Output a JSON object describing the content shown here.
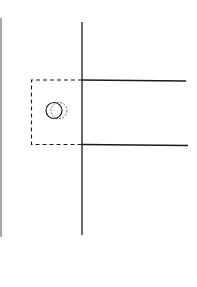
{
  "diagram": {
    "kind": "line-drawing",
    "colors": {
      "background": "#ffffff",
      "stroke": "#1a1a1a",
      "edge": "#8a8a8a"
    },
    "elements": [
      {
        "name": "left-edge-line",
        "type": "line",
        "style": "solid"
      },
      {
        "name": "main-vertical-line",
        "type": "line",
        "style": "solid"
      },
      {
        "name": "top-horizontal-line",
        "type": "line",
        "style": "solid"
      },
      {
        "name": "bottom-horizontal-line",
        "type": "line",
        "style": "solid"
      },
      {
        "name": "dashed-box",
        "type": "rectangle",
        "style": "dashed"
      },
      {
        "name": "solid-circle",
        "type": "circle",
        "style": "solid"
      },
      {
        "name": "dashed-circle",
        "type": "circle",
        "style": "dashed"
      }
    ]
  }
}
